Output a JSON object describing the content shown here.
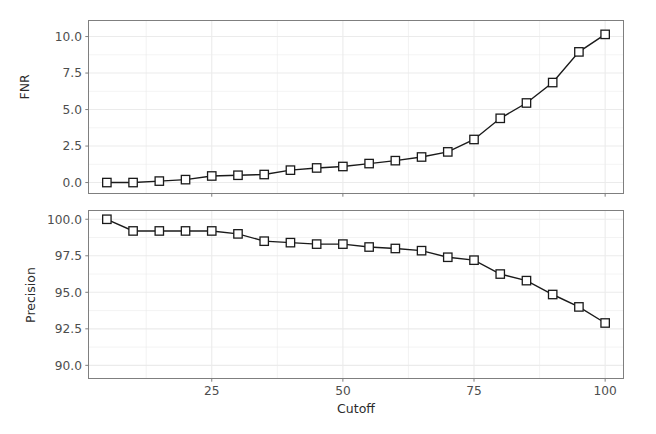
{
  "figure": {
    "background": "#ffffff",
    "panel_border_color": "#7f7f7f",
    "grid_color": "#ebebeb",
    "line_color": "#1a1a1a",
    "marker_fill": "#ffffff",
    "marker_edge": "#1a1a1a",
    "tick_color": "#4d4d4d",
    "width": 656,
    "height": 434
  },
  "chart_data": [
    {
      "type": "line",
      "title": "",
      "xlabel": "",
      "ylabel": "FNR",
      "xlim": [
        1.5,
        103.5
      ],
      "ylim": [
        -0.75,
        11.1
      ],
      "xticks": [
        25,
        50,
        75,
        100
      ],
      "xticklabels": [
        "",
        "",
        "",
        ""
      ],
      "yticks": [
        0.0,
        2.5,
        5.0,
        7.5,
        10.0
      ],
      "yticklabels": [
        "0.0",
        "2.5",
        "5.0",
        "7.5",
        "10.0"
      ],
      "grid": true,
      "legend": "none",
      "marker": "square-open",
      "x": [
        5,
        10,
        15,
        20,
        25,
        30,
        35,
        40,
        45,
        50,
        55,
        60,
        65,
        70,
        75,
        80,
        85,
        90,
        95,
        100
      ],
      "y": [
        0.0,
        0.0,
        0.1,
        0.2,
        0.45,
        0.5,
        0.55,
        0.85,
        1.0,
        1.1,
        1.3,
        1.5,
        1.75,
        2.1,
        2.95,
        4.4,
        5.45,
        6.85,
        8.95,
        10.15
      ]
    },
    {
      "type": "line",
      "title": "",
      "xlabel": "Cutoff",
      "ylabel": "Precision",
      "xlim": [
        1.5,
        103.5
      ],
      "ylim": [
        89.1,
        100.6
      ],
      "xticks": [
        25,
        50,
        75,
        100
      ],
      "xticklabels": [
        "25",
        "50",
        "75",
        "100"
      ],
      "yticks": [
        90.0,
        92.5,
        95.0,
        97.5,
        100.0
      ],
      "yticklabels": [
        "90.0",
        "92.5",
        "95.0",
        "97.5",
        "100.0"
      ],
      "grid": true,
      "legend": "none",
      "marker": "square-open",
      "x": [
        5,
        10,
        15,
        20,
        25,
        30,
        35,
        40,
        45,
        50,
        55,
        60,
        65,
        70,
        75,
        80,
        85,
        90,
        95,
        100
      ],
      "y": [
        100.0,
        99.2,
        99.2,
        99.2,
        99.2,
        99.0,
        98.5,
        98.4,
        98.3,
        98.3,
        98.1,
        98.0,
        97.85,
        97.4,
        97.2,
        96.25,
        95.8,
        94.85,
        94.0,
        92.9
      ]
    }
  ],
  "labels": {
    "fnr_axis_title": "FNR",
    "precision_axis_title": "Precision",
    "x_axis_title": "Cutoff"
  }
}
